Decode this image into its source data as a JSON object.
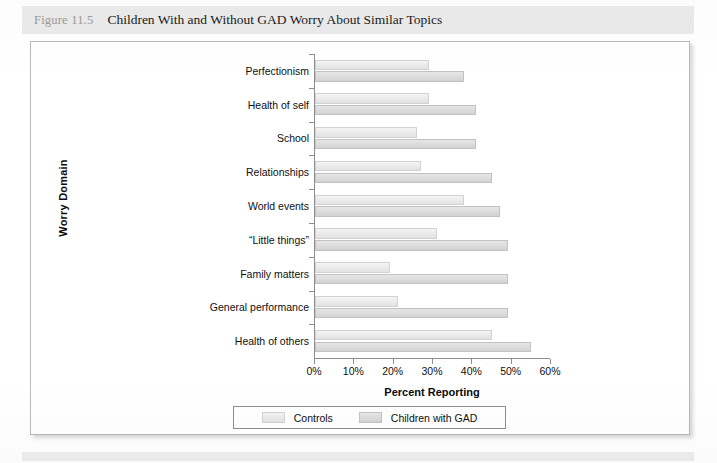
{
  "figure": {
    "number": "Figure 11.5",
    "title": "Children With and Without GAD Worry About Similar Topics"
  },
  "chart_data": {
    "type": "bar",
    "orientation": "horizontal",
    "title": "Children With and Without GAD Worry About Similar Topics",
    "xlabel": "Percent Reporting",
    "ylabel": "Worry Domain",
    "xlim": [
      0,
      60
    ],
    "xticks": [
      0,
      10,
      20,
      30,
      40,
      50,
      60
    ],
    "xtick_labels": [
      "0%",
      "10%",
      "20%",
      "30%",
      "40%",
      "50%",
      "60%"
    ],
    "grid": false,
    "legend_position": "bottom",
    "categories": [
      "Perfectionism",
      "Health of self",
      "School",
      "Relationships",
      "World events",
      "“Little things”",
      "Family matters",
      "General performance",
      "Health of others"
    ],
    "series": [
      {
        "name": "Controls",
        "color": "#eaeaea",
        "values": [
          29,
          29,
          26,
          27,
          38,
          31,
          19,
          21,
          45
        ]
      },
      {
        "name": "Children with GAD",
        "color": "#dcdcdc",
        "values": [
          38,
          41,
          41,
          45,
          47,
          49,
          49,
          49,
          55
        ]
      }
    ]
  },
  "legend": {
    "items": [
      {
        "label": "Controls",
        "swatch": "controls"
      },
      {
        "label": "Children with GAD",
        "swatch": "gad"
      }
    ]
  }
}
